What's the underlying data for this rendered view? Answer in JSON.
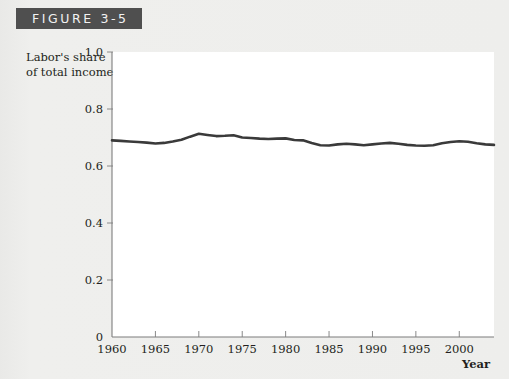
{
  "figure": {
    "banner_label": "FIGURE 3-5"
  },
  "axes": {
    "y_label_line1": "Labor's share",
    "y_label_line2": "of total income",
    "x_label": "Year",
    "y_ticks": [
      "0",
      "0.2",
      "0.4",
      "0.6",
      "0.8",
      "1.0"
    ],
    "x_ticks": [
      "1960",
      "1965",
      "1970",
      "1975",
      "1980",
      "1985",
      "1990",
      "1995",
      "2000"
    ]
  },
  "colors": {
    "banner_bg": "#4f4f4f",
    "banner_text": "#f2f2f2",
    "page_bg": "#eeeeec",
    "plot_bg": "#ffffff",
    "line": "#3a3a3a",
    "axis": "#7d7d7d"
  },
  "chart_data": {
    "type": "line",
    "title": "FIGURE 3-5",
    "xlabel": "Year",
    "ylabel": "Labor's share of total income",
    "xlim": [
      1960,
      2004
    ],
    "ylim": [
      0,
      1.0
    ],
    "y_tick_values": [
      0,
      0.2,
      0.4,
      0.6,
      0.8,
      1.0
    ],
    "x_tick_values": [
      1960,
      1965,
      1970,
      1975,
      1980,
      1985,
      1990,
      1995,
      2000
    ],
    "grid": false,
    "legend": "none",
    "series": [
      {
        "name": "Labor's share of total income",
        "x": [
          1960,
          1961,
          1962,
          1963,
          1964,
          1965,
          1966,
          1967,
          1968,
          1969,
          1970,
          1971,
          1972,
          1973,
          1974,
          1975,
          1976,
          1977,
          1978,
          1979,
          1980,
          1981,
          1982,
          1983,
          1984,
          1985,
          1986,
          1987,
          1988,
          1989,
          1990,
          1991,
          1992,
          1993,
          1994,
          1995,
          1996,
          1997,
          1998,
          1999,
          2000,
          2001,
          2002,
          2003,
          2004
        ],
        "values": [
          0.69,
          0.688,
          0.686,
          0.684,
          0.682,
          0.679,
          0.681,
          0.686,
          0.692,
          0.703,
          0.713,
          0.709,
          0.705,
          0.706,
          0.708,
          0.7,
          0.698,
          0.696,
          0.695,
          0.696,
          0.697,
          0.691,
          0.69,
          0.681,
          0.673,
          0.672,
          0.676,
          0.678,
          0.676,
          0.673,
          0.676,
          0.679,
          0.681,
          0.678,
          0.674,
          0.672,
          0.671,
          0.673,
          0.68,
          0.684,
          0.687,
          0.685,
          0.68,
          0.676,
          0.674
        ]
      }
    ]
  }
}
